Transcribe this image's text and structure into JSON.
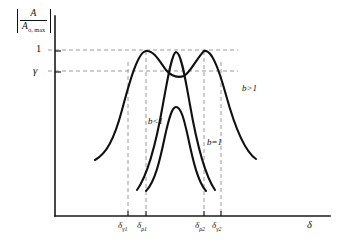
{
  "figure": {
    "background_color": "#ffffff",
    "curve_color": "#111111",
    "guide_color": "#9a9a9a",
    "axis_color": "#1a1a1a"
  },
  "axes": {
    "y_label_numerator": "A",
    "y_label_denominator_main": "A",
    "y_label_denominator_sub": "σ, max",
    "y_label_full": "|A / Aσ,max|",
    "x_label": "δ",
    "y_ticks": [
      {
        "label": "1",
        "value": 1.0,
        "y_px": 50
      },
      {
        "label": "γ",
        "value": 0.72,
        "y_px": 71
      }
    ],
    "x_ticks": [
      {
        "base": "δ",
        "sub": "γ1",
        "label": "δγ1",
        "x_px": 128
      },
      {
        "base": "δ",
        "sub": "ρ1",
        "label": "δρ1",
        "x_px": 146
      },
      {
        "base": "δ",
        "sub": "ρ2",
        "label": "δρ2",
        "x_px": 204
      },
      {
        "base": "δ",
        "sub": "γ2",
        "label": "δγ2",
        "x_px": 221
      }
    ]
  },
  "annotations": [
    {
      "id": "b-greater-than-one",
      "var": "b",
      "op": ">",
      "num": "1",
      "text": "b > 1"
    },
    {
      "id": "b-less-than-one",
      "var": "b",
      "op": "<",
      "num": "1",
      "text": "b < 1"
    },
    {
      "id": "b-equals-one",
      "var": "b",
      "op": "=",
      "num": "1",
      "text": "b = 1"
    }
  ],
  "chart_data": {
    "type": "line",
    "title": "",
    "xlabel": "δ",
    "ylabel": "|A / Aσ,max|",
    "xlim": [
      55,
      330
    ],
    "ylim": [
      0,
      1.12
    ],
    "grid": false,
    "legend": "inline-annotations",
    "y_reference_levels": [
      {
        "name": "1",
        "value": 1.0
      },
      {
        "name": "γ",
        "value": 0.72
      }
    ],
    "x_reference_points": [
      {
        "name": "δγ1",
        "value": 128
      },
      {
        "name": "δρ1",
        "value": 146
      },
      {
        "name": "δρ2",
        "value": 204
      },
      {
        "name": "δγ2",
        "value": 221
      }
    ],
    "series": [
      {
        "name": "b > 1",
        "description": "double-humped response, twin peaks at δρ1 and δρ2 both reaching amplitude 1, local dip to γ between them",
        "path": "M 95,160 C 106,154 114,140 122,110 C 130,80 138,52 146,51 C 154,50 160,62 166,70 C 172,77 178,78 184,76 C 190,73 197,58 204,51 C 211,49 218,66 226,95 C 234,124 244,151 256,159",
        "peaks": [
          {
            "x": 146,
            "y": 1.0
          },
          {
            "x": 204,
            "y": 1.0
          }
        ],
        "dip": {
          "x": 178,
          "y": 0.72
        }
      },
      {
        "name": "b = 1",
        "description": "single narrow peak centered between δρ1 and δρ2, reaching amplitude 1",
        "path": "M 137,190 C 147,176 156,144 163,104 C 168,76 172,53 176,52 C 181,52 185,77 190,105 C 197,145 206,177 215,190",
        "peaks": [
          {
            "x": 176,
            "y": 1.0
          }
        ]
      },
      {
        "name": "b < 1",
        "description": "single lower rounded peak centered between δρ1 and δρ2, reaching roughly 0.55",
        "path": "M 146,191 C 155,182 160,160 165,136 C 169,118 172,107 176,107 C 181,107 184,119 188,137 C 193,161 198,182 206,191",
        "peaks": [
          {
            "x": 176,
            "y": 0.55
          }
        ]
      }
    ]
  }
}
